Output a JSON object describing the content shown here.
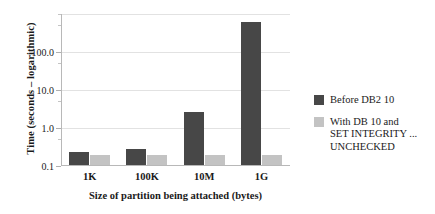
{
  "chart_data": {
    "type": "bar",
    "title": "",
    "xlabel": "Size of partition being attached (bytes)",
    "ylabel": "Time (seconds – logarithmic)",
    "categories": [
      "1K",
      "100K",
      "10M",
      "1G"
    ],
    "yscale": "log",
    "ylim": [
      0.1,
      1000
    ],
    "ytick_labels": [
      "0.1",
      "1.0",
      "10.0",
      "100.0"
    ],
    "ytick_values": [
      0.1,
      1.0,
      10.0,
      100.0
    ],
    "grid": true,
    "legend_position": "right",
    "series": [
      {
        "name": "Before DB2 10",
        "color": "#474747",
        "values": [
          0.22,
          0.27,
          2.5,
          580
        ]
      },
      {
        "name": "With DB 10 and\nSET INTEGRITY ...\nUNCHECKED",
        "color": "#c3c3c3",
        "values": [
          0.18,
          0.18,
          0.18,
          0.18
        ]
      }
    ]
  },
  "axes": {
    "y_title": "Time (seconds – logarithmic)",
    "x_title": "Size of partition being attached (bytes)"
  },
  "legend": {
    "entries": [
      {
        "label": "Before DB2 10",
        "color": "#474747"
      },
      {
        "label": "With DB 10 and\nSET INTEGRITY ...\nUNCHECKED",
        "color": "#c3c3c3"
      }
    ]
  },
  "colors": {
    "series_dark": "#474747",
    "series_light": "#c3c3c3",
    "gridline": "#e2e2e2",
    "axis": "#b8b8b8",
    "text": "#1a1a1a",
    "background": "#ffffff"
  }
}
